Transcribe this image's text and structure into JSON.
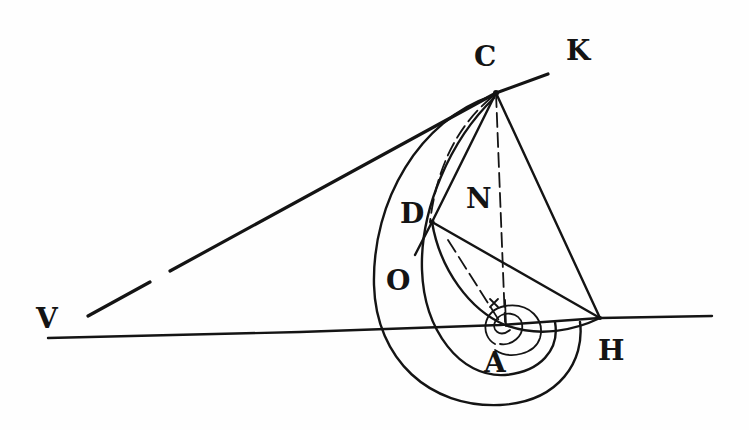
{
  "diagram": {
    "type": "geometric-figure",
    "ink_color": "#141414",
    "paper_color": "#fefefe",
    "labels": {
      "C": "C",
      "K": "K",
      "N": "N",
      "D": "D",
      "O": "O",
      "V": "V",
      "A": "A",
      "H": "H"
    },
    "segments": [
      {
        "name": "tangent-VK",
        "from": "V",
        "to": "K"
      },
      {
        "name": "baseline-VH",
        "from": "V",
        "to": "H"
      },
      {
        "name": "line-CH",
        "from": "C",
        "to": "H"
      },
      {
        "name": "line-CS",
        "from": "C",
        "to": "S"
      },
      {
        "name": "line-DH",
        "from": "D",
        "to": "H"
      },
      {
        "name": "line-CD",
        "from": "C",
        "to": "D"
      },
      {
        "name": "line-DS",
        "from": "D",
        "to": "S"
      }
    ],
    "curves": [
      "outer-spiral-arc",
      "inner-spiral-arc",
      "circle-arc-through-D",
      "small-spiral-coils-at-A"
    ]
  }
}
